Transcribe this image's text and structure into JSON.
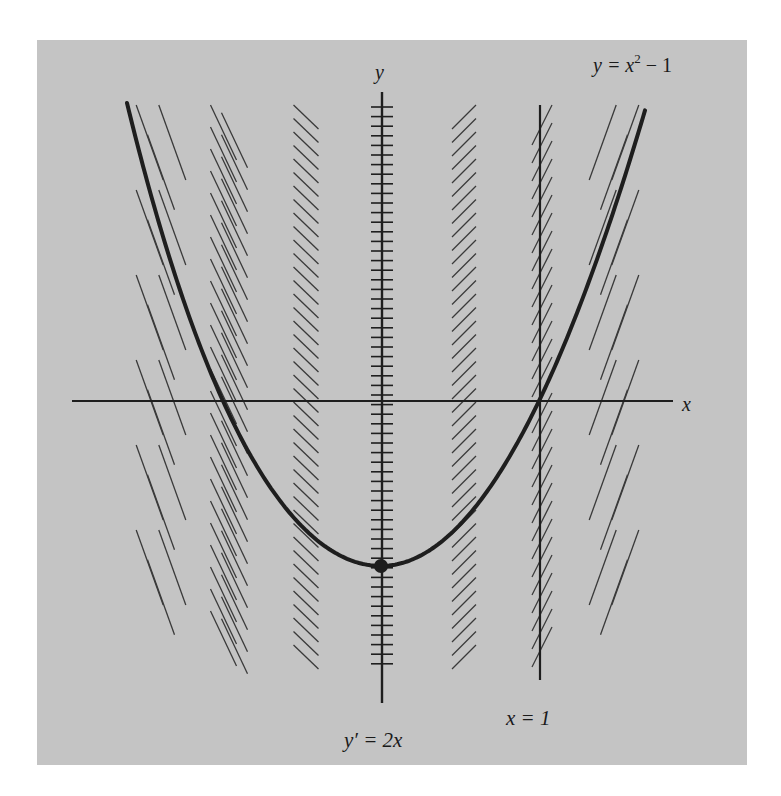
{
  "figure": {
    "background": "#ffffff",
    "panel_color": "#c4c4c4",
    "ink_color": "#1e1e1e",
    "hatch_color": "#3a3a3a",
    "panel": {
      "x": 37,
      "y": 40,
      "w": 710,
      "h": 725
    }
  },
  "labels": {
    "y_axis": "y",
    "x_axis": "x",
    "curve_lhs": "y = x",
    "curve_exp": "2",
    "curve_rhs": " − 1",
    "isocline_axis": "y′ = 2x",
    "vertical_line": "x = 1"
  },
  "chart_data": {
    "type": "line",
    "title": "",
    "xlabel": "x",
    "ylabel": "y",
    "curve": {
      "equation": "y = x^2 - 1",
      "vertex": [
        0,
        -1
      ],
      "x_intercepts": [
        -1,
        1
      ]
    },
    "isoclines": [
      {
        "x": -1.5,
        "slope": -3
      },
      {
        "x": -1.0,
        "slope": -2
      },
      {
        "x": -0.5,
        "slope": -1
      },
      {
        "x": 0.0,
        "slope": 0
      },
      {
        "x": 0.5,
        "slope": 1
      },
      {
        "x": 1.0,
        "slope": 2
      },
      {
        "x": 1.5,
        "slope": 3
      }
    ],
    "annotations": [
      "y = x^2 - 1",
      "y' = 2x",
      "x = 1"
    ],
    "grid": false,
    "legend": null
  },
  "geometry": {
    "origin_px": [
      382,
      401
    ],
    "unit_x_px": 158,
    "x_axis": {
      "x1": 72,
      "x2": 673,
      "y": 401
    },
    "y_axis": {
      "x": 382,
      "y1": 92,
      "y2": 703
    },
    "y_ticks": {
      "y_start": 107,
      "y_end": 672,
      "spacing": 9.6,
      "half_len": 11
    },
    "vertex_px": [
      381,
      566
    ],
    "curve_left_top_px": [
      127,
      103
    ],
    "curve_right_top_px": [
      646,
      107
    ],
    "vertical_line": {
      "x": 540,
      "y1": 105,
      "y2": 680
    },
    "hatch_groups": [
      {
        "cx": 161,
        "y1": 105,
        "y2": 677,
        "dx": 27,
        "dy": 75,
        "dir": -1,
        "rows": 3,
        "spacing": 85
      },
      {
        "cx": 229,
        "y1": 105,
        "y2": 677,
        "dx": 26,
        "dy": 55,
        "dir": -1,
        "rows": 2,
        "spacing": 22
      },
      {
        "cx": 306,
        "y1": 105,
        "y2": 677,
        "dx": 25,
        "dy": 24,
        "dir": -1,
        "rows": 1,
        "spacing": 13.5
      },
      {
        "cx": 464,
        "y1": 105,
        "y2": 677,
        "dx": 24,
        "dy": 24,
        "dir": 1,
        "rows": 1,
        "spacing": 13.5
      },
      {
        "cx": 542,
        "y1": 105,
        "y2": 677,
        "dx": 20,
        "dy": 40,
        "dir": 1,
        "rows": 1,
        "spacing": 18
      },
      {
        "cx": 614,
        "y1": 105,
        "y2": 677,
        "dx": 27,
        "dy": 75,
        "dir": 1,
        "rows": 3,
        "spacing": 85
      }
    ]
  }
}
